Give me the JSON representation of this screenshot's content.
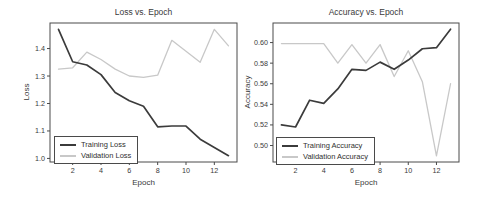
{
  "style": {
    "background": "#ffffff",
    "axis_color": "#4a4a4a",
    "text_color": "#3a3a3a",
    "training_color": "#3b3b3b",
    "validation_color": "#c8c8c8"
  },
  "chart_data": [
    {
      "type": "line",
      "title": "Loss vs. Epoch",
      "xlabel": "Epoch",
      "ylabel": "Loss",
      "grid": false,
      "legend_position": "lower-left",
      "x": [
        1,
        2,
        3,
        4,
        5,
        6,
        7,
        8,
        9,
        10,
        11,
        12,
        13
      ],
      "series": [
        {
          "name": "Training Loss",
          "color": "#3b3b3b",
          "values": [
            1.47,
            1.352,
            1.34,
            1.305,
            1.24,
            1.21,
            1.19,
            1.115,
            1.118,
            1.118,
            1.07,
            1.04,
            1.01
          ]
        },
        {
          "name": "Validation Loss",
          "color": "#c8c8c8",
          "values": [
            1.325,
            1.33,
            1.387,
            1.36,
            1.325,
            1.3,
            1.295,
            1.303,
            1.43,
            1.39,
            1.35,
            1.47,
            1.41
          ]
        }
      ],
      "xlim": [
        0.4,
        13.6
      ],
      "ylim": [
        0.987,
        1.493
      ],
      "xticks": {
        "values": [
          2,
          4,
          6,
          8,
          10,
          12
        ],
        "labels": [
          "2",
          "4",
          "6",
          "8",
          "10",
          "12"
        ]
      },
      "yticks": {
        "values": [
          1.0,
          1.1,
          1.2,
          1.3,
          1.4
        ],
        "labels": [
          "1.0",
          "1.1",
          "1.2",
          "1.3",
          "1.4"
        ]
      }
    },
    {
      "type": "line",
      "title": "Accuracy vs. Epoch",
      "xlabel": "Epoch",
      "ylabel": "Accuracy",
      "grid": false,
      "legend_position": "lower-left",
      "x": [
        1,
        2,
        3,
        4,
        5,
        6,
        7,
        8,
        9,
        10,
        11,
        12,
        13
      ],
      "series": [
        {
          "name": "Training Accuracy",
          "color": "#3b3b3b",
          "values": [
            0.52,
            0.518,
            0.544,
            0.541,
            0.555,
            0.574,
            0.573,
            0.581,
            0.574,
            0.583,
            0.594,
            0.595,
            0.613
          ]
        },
        {
          "name": "Validation Accuracy",
          "color": "#c8c8c8",
          "values": [
            0.599,
            0.599,
            0.599,
            0.599,
            0.58,
            0.598,
            0.58,
            0.598,
            0.567,
            0.592,
            0.562,
            0.49,
            0.56
          ]
        }
      ],
      "xlim": [
        0.4,
        13.6
      ],
      "ylim": [
        0.484,
        0.619
      ],
      "xticks": {
        "values": [
          2,
          4,
          6,
          8,
          10,
          12
        ],
        "labels": [
          "2",
          "4",
          "6",
          "8",
          "10",
          "12"
        ]
      },
      "yticks": {
        "values": [
          0.5,
          0.52,
          0.54,
          0.56,
          0.58,
          0.6
        ],
        "labels": [
          "0.50",
          "0.52",
          "0.54",
          "0.56",
          "0.58",
          "0.60"
        ]
      }
    }
  ]
}
